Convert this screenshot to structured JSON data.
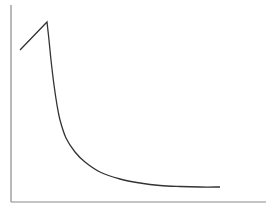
{
  "chart_data": {
    "type": "line",
    "title": "",
    "xlabel": "",
    "ylabel": "",
    "grid": false,
    "legend": null,
    "series": [
      {
        "name": "curve",
        "points_px": [
          [
            20,
            50
          ],
          [
            47,
            22
          ],
          [
            49,
            40
          ],
          [
            51,
            60
          ],
          [
            54,
            85
          ],
          [
            57,
            105
          ],
          [
            60,
            120
          ],
          [
            66,
            138
          ],
          [
            75,
            152
          ],
          [
            85,
            162
          ],
          [
            100,
            172
          ],
          [
            120,
            179
          ],
          [
            140,
            183
          ],
          [
            160,
            185.5
          ],
          [
            180,
            186.5
          ],
          [
            200,
            187
          ],
          [
            220,
            187
          ]
        ]
      }
    ],
    "axes": {
      "origin_px": [
        11,
        202
      ],
      "y_top_px": 5,
      "x_right_px": 266
    },
    "colors": {
      "axis": "#8a8a8a",
      "line": "#333333"
    }
  }
}
